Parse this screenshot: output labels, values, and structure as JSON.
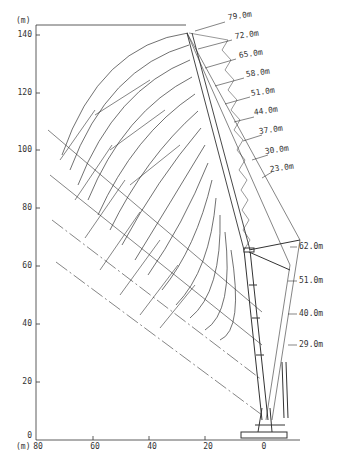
{
  "diagram": {
    "type": "crane-working-range-chart",
    "units": "(m)",
    "y_axis": {
      "unit_label": "(m)",
      "ticks": [
        "140",
        "120",
        "100",
        "80",
        "60",
        "40",
        "20",
        "0"
      ],
      "values": [
        140,
        120,
        100,
        80,
        60,
        40,
        20,
        0
      ]
    },
    "x_axis": {
      "unit_label": "(m)",
      "ticks": [
        "80",
        "60",
        "40",
        "20",
        "0"
      ],
      "values": [
        80,
        60,
        40,
        20,
        0
      ]
    },
    "luffing_jib_lengths": [
      "79.0m",
      "72.0m",
      "65.0m",
      "58.0m",
      "51.0m",
      "44.0m",
      "37.0m",
      "30.0m",
      "23.0m"
    ],
    "main_boom_lengths": [
      "62.0m",
      "51.0m",
      "40.0m",
      "29.0m"
    ],
    "line_color": "#333333",
    "background": "#ffffff"
  }
}
